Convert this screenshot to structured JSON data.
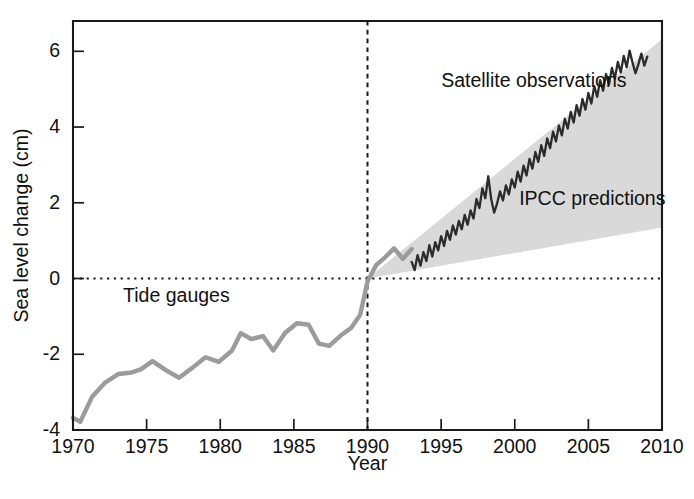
{
  "chart_data": {
    "type": "line",
    "title": "",
    "xlabel": "Year",
    "ylabel": "Sea level change (cm)",
    "xlim": [
      1970,
      2010
    ],
    "ylim": [
      -4,
      6.8
    ],
    "xticks": [
      1970,
      1975,
      1980,
      1985,
      1990,
      1995,
      2000,
      2005,
      2010
    ],
    "xticklabels": [
      "1970",
      "1975",
      "1980",
      "1985",
      "1990",
      "1995",
      "2000",
      "2005",
      "2010"
    ],
    "yticks": [
      6,
      4,
      2,
      0,
      -2,
      -4
    ],
    "yticklabels": [
      "6",
      "4",
      "2",
      "0",
      "-2",
      "-4"
    ],
    "grid": false,
    "legend_position": "inline-annotations",
    "colors": {
      "tide_gauges": "#9b9b9b",
      "satellite": "#2b2b2b",
      "ipcc_band": "#d9d9d9",
      "axis": "#1a1a1a"
    },
    "annotations": [
      {
        "text": "Satellite observations",
        "x": 1995.0,
        "y": 5.05,
        "anchor": "start"
      },
      {
        "text": "IPCC predictions",
        "x": 2000.3,
        "y": 1.95,
        "anchor": "start"
      },
      {
        "text": "Tide gauges",
        "x": 1973.4,
        "y": -0.62,
        "anchor": "start"
      }
    ],
    "reference_lines": [
      {
        "name": "zero-sea-level",
        "orientation": "horizontal",
        "value": 0,
        "style": "dotted"
      },
      {
        "name": "year-1990-divider",
        "orientation": "vertical",
        "value": 1990,
        "style": "dashed"
      }
    ],
    "series": [
      {
        "name": "Tide gauges",
        "style": "line",
        "color": "#9b9b9b",
        "x": [
          1970.0,
          1970.5,
          1971.3,
          1972.2,
          1973.1,
          1974.0,
          1974.6,
          1975.4,
          1976.3,
          1977.2,
          1978.1,
          1979.0,
          1979.9,
          1980.8,
          1981.4,
          1982.1,
          1982.9,
          1983.6,
          1984.4,
          1985.2,
          1986.0,
          1986.7,
          1987.4,
          1988.2,
          1988.9,
          1989.5,
          1990.0,
          1990.6,
          1991.2,
          1991.8,
          1992.4,
          1993.0
        ],
        "y": [
          -3.68,
          -3.78,
          -3.12,
          -2.74,
          -2.52,
          -2.48,
          -2.4,
          -2.18,
          -2.42,
          -2.62,
          -2.36,
          -2.08,
          -2.2,
          -1.9,
          -1.44,
          -1.6,
          -1.52,
          -1.9,
          -1.44,
          -1.18,
          -1.22,
          -1.72,
          -1.78,
          -1.5,
          -1.3,
          -0.96,
          -0.08,
          0.36,
          0.56,
          0.8,
          0.52,
          0.78
        ]
      },
      {
        "name": "Satellite observations",
        "style": "line",
        "color": "#2b2b2b",
        "x": [
          1993.0,
          1993.2,
          1993.4,
          1993.6,
          1993.8,
          1994.0,
          1994.2,
          1994.4,
          1994.6,
          1994.8,
          1995.0,
          1995.2,
          1995.4,
          1995.6,
          1995.8,
          1996.0,
          1996.2,
          1996.4,
          1996.6,
          1996.8,
          1997.0,
          1997.2,
          1997.4,
          1997.6,
          1997.8,
          1998.0,
          1998.2,
          1998.4,
          1998.6,
          1998.8,
          1999.0,
          1999.2,
          1999.4,
          1999.6,
          1999.8,
          2000.0,
          2000.2,
          2000.4,
          2000.6,
          2000.8,
          2001.0,
          2001.2,
          2001.4,
          2001.6,
          2001.8,
          2002.0,
          2002.2,
          2002.4,
          2002.6,
          2002.8,
          2003.0,
          2003.2,
          2003.4,
          2003.6,
          2003.8,
          2004.0,
          2004.2,
          2004.4,
          2004.6,
          2004.8,
          2005.0,
          2005.2,
          2005.4,
          2005.6,
          2005.8,
          2006.0,
          2006.2,
          2006.4,
          2006.6,
          2006.8,
          2007.0,
          2007.2,
          2007.4,
          2007.6,
          2007.8,
          2008.0,
          2008.2,
          2008.4,
          2008.6,
          2008.8,
          2009.0
        ],
        "y": [
          0.44,
          0.22,
          0.62,
          0.34,
          0.7,
          0.46,
          0.88,
          0.58,
          0.96,
          0.74,
          1.12,
          0.86,
          1.26,
          1.02,
          1.4,
          1.16,
          1.52,
          1.3,
          1.68,
          1.42,
          1.8,
          1.58,
          2.1,
          1.86,
          2.38,
          2.12,
          2.7,
          2.1,
          1.74,
          1.98,
          2.3,
          2.06,
          2.46,
          2.22,
          2.62,
          2.4,
          2.82,
          2.56,
          2.98,
          2.72,
          3.16,
          2.9,
          3.34,
          3.08,
          3.52,
          3.24,
          3.7,
          3.44,
          3.88,
          3.62,
          4.04,
          3.78,
          4.22,
          3.96,
          4.4,
          4.12,
          4.58,
          4.3,
          4.74,
          4.46,
          4.9,
          4.62,
          5.08,
          4.8,
          5.24,
          4.96,
          5.4,
          5.12,
          5.56,
          5.28,
          5.72,
          5.44,
          5.88,
          5.58,
          6.02,
          5.7,
          5.42,
          5.66,
          5.94,
          5.62,
          5.86
        ]
      }
    ],
    "bands": [
      {
        "name": "IPCC predictions",
        "color": "#d9d9d9",
        "x": [
          1990,
          2010
        ],
        "lower": [
          0.0,
          1.35
        ],
        "upper": [
          0.0,
          6.32
        ]
      }
    ]
  }
}
